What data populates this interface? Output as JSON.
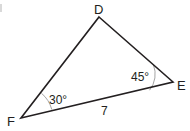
{
  "figure": {
    "type": "triangle",
    "vertices": {
      "D": {
        "label": "D",
        "x": 99,
        "y": 17
      },
      "E": {
        "label": "E",
        "x": 173,
        "y": 82
      },
      "F": {
        "label": "F",
        "x": 21,
        "y": 118
      }
    },
    "angles": {
      "E": {
        "label": "45°",
        "value": 45
      },
      "F": {
        "label": "30°",
        "value": 30
      }
    },
    "sides": {
      "FE": {
        "label": "7",
        "value": 7
      }
    },
    "colors": {
      "stroke": "#231f20",
      "arc": "#9a9a9a",
      "background": "#ffffff"
    }
  }
}
